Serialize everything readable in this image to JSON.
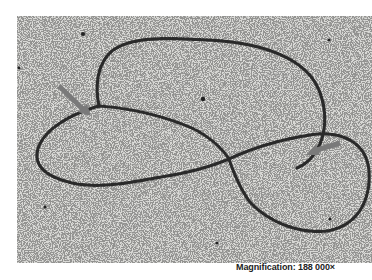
{
  "figure": {
    "type": "electron micrograph",
    "caption": "Magnification: 188 000×",
    "annotations": [
      {
        "name": "left-arrow",
        "points_to": "junction of upper loop and left lobe"
      },
      {
        "name": "right-arrow",
        "points_to": "strand near right lobe"
      }
    ],
    "colors": {
      "background": "#d9d9d6",
      "beads": "#2a2a2a",
      "arrow": "#7a7a7a"
    }
  }
}
